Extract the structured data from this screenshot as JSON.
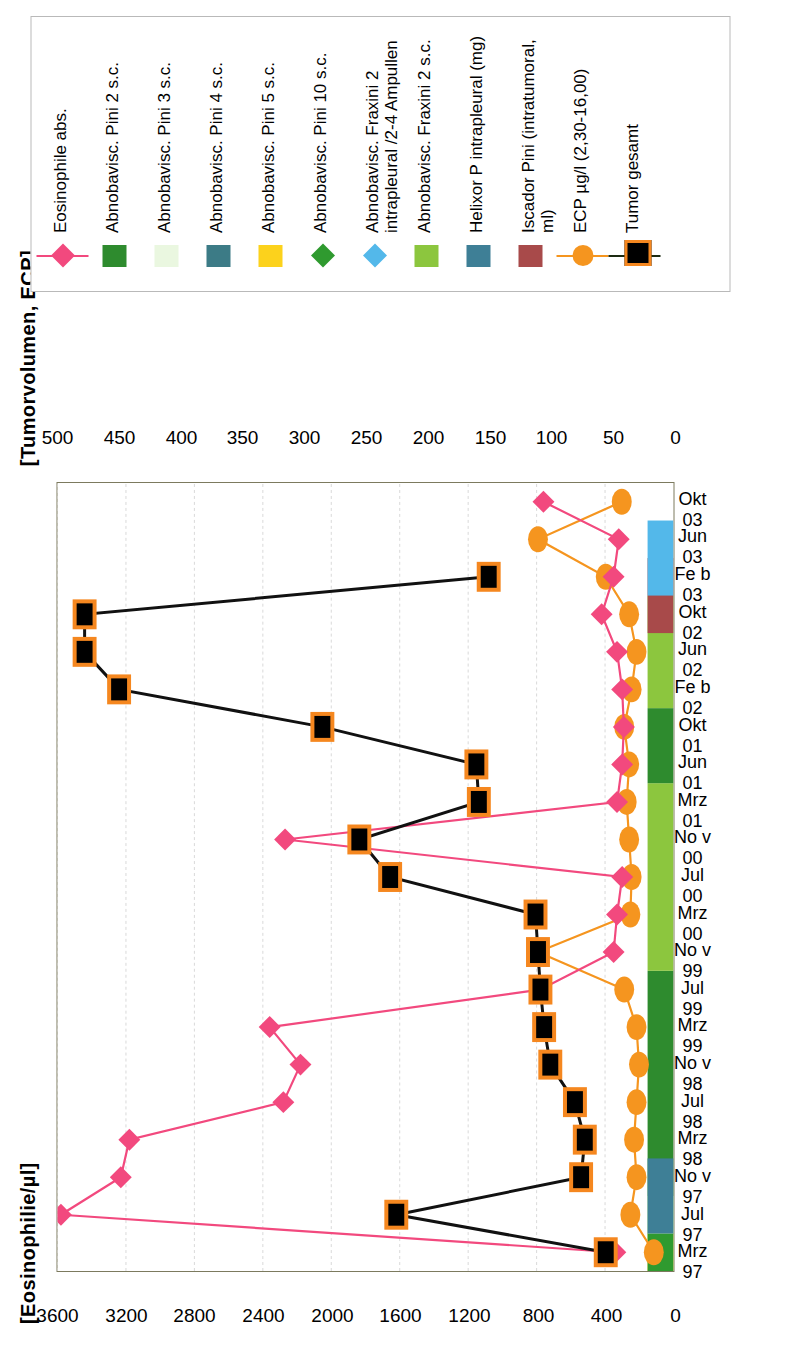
{
  "axes": {
    "left_title": "[Eosinophilie/µl]",
    "right_title": "[Tumorvolumen, ECP]",
    "primary_ticks": [
      "0",
      "400",
      "800",
      "1200",
      "1600",
      "2000",
      "2400",
      "2800",
      "3200",
      "3600"
    ],
    "secondary_ticks": [
      "0",
      "50",
      "100",
      "150",
      "200",
      "250",
      "300",
      "350",
      "400",
      "450",
      "500"
    ],
    "categories": [
      "Mrz\n97",
      "Jul\n97",
      "No\nv\n97",
      "Mrz\n98",
      "Jul\n98",
      "No\nv\n98",
      "Mrz\n99",
      "Jul\n99",
      "No\nv\n99",
      "Mrz\n00",
      "Jul\n00",
      "No\nv\n00",
      "Mrz\n01",
      "Jun\n01",
      "Okt\n01",
      "Fe\nb\n02",
      "Jun\n02",
      "Okt\n02",
      "Fe\nb\n03",
      "Jun\n03",
      "Okt\n03"
    ]
  },
  "legend": {
    "items": [
      {
        "label": "Eosinophile abs.",
        "key": "line-diamond",
        "color": "#f2497e",
        "name": "legend-eosinophile-abs"
      },
      {
        "label": "Abnobavisc. Pini 2 s.c.",
        "key": "square",
        "color": "#2e8b2e",
        "name": "legend-abnoba-pini-2-sc"
      },
      {
        "label": "Abnobavisc. Pini 3 s.c.",
        "key": "square",
        "color": "#eaf7e0",
        "name": "legend-abnoba-pini-3-sc"
      },
      {
        "label": "Abnobavisc. Pini 4 s.c.",
        "key": "square",
        "color": "#3c7b86",
        "name": "legend-abnoba-pini-4-sc"
      },
      {
        "label": "Abnobavisc. Pini 5 s.c.",
        "key": "square",
        "color": "#fcd21c",
        "name": "legend-abnoba-pini-5-sc"
      },
      {
        "label": "Abnobavisc. Pini 10 s.c.",
        "key": "diamond",
        "color": "#2f9a2f",
        "name": "legend-abnoba-pini-10-sc"
      },
      {
        "label": "Abnobavisc. Fraxini 2\nintrapleural /2-4 Ampullen",
        "key": "diamond",
        "color": "#53b8ea",
        "name": "legend-abnoba-fraxini-2-intrapleural"
      },
      {
        "label": "Abnobavisc. Fraxini 2 s.c.",
        "key": "square",
        "color": "#8cc63e",
        "name": "legend-abnoba-fraxini-2-sc"
      },
      {
        "label": "Helixor P intrapleural (mg)",
        "key": "square",
        "color": "#3e7f96",
        "name": "legend-helixor-p-intrapleural"
      },
      {
        "label": "Iscador Pini (intratumoral,\nml)",
        "key": "square",
        "color": "#a84a4a",
        "name": "legend-iscador-pini-intratumoral"
      },
      {
        "label": "ECP µg/l (2,30-16,00)",
        "key": "line-circle",
        "color": "#f5951f",
        "name": "legend-ecp"
      },
      {
        "label": "Tumor gesamt",
        "key": "tumor",
        "color": "#000000",
        "name": "legend-tumor-gesamt"
      }
    ]
  },
  "chart_data": {
    "type": "line",
    "title": "",
    "xlabel": "",
    "ylabel": "[Eosinophilie/µl]",
    "y2label": "[Tumorvolumen, ECP]",
    "ylim": [
      0,
      3600
    ],
    "y2lim": [
      0,
      500
    ],
    "grid": true,
    "legend_position": "right",
    "x": [
      "Mrz 97",
      "Jul 97",
      "Nov 97",
      "Mrz 98",
      "Jul 98",
      "Nov 98",
      "Mrz 99",
      "Jul 99",
      "Nov 99",
      "Mrz 00",
      "Jul 00",
      "Nov 00",
      "Mrz 01",
      "Jun 01",
      "Okt 01",
      "Feb 02",
      "Jun 02",
      "Okt 02",
      "Feb 03",
      "Jun 03",
      "Okt 03"
    ],
    "series": [
      {
        "name": "Eosinophile abs.",
        "axis": "primary",
        "unit": "/µl",
        "color": "#f2497e",
        "marker": "diamond",
        "values": [
          340,
          3580,
          3230,
          3180,
          2280,
          2180,
          2360,
          780,
          350,
          330,
          300,
          2270,
          330,
          300,
          290,
          300,
          330,
          420,
          350,
          320,
          760
        ]
      },
      {
        "name": "ECP µg/l (2,30-16,00)",
        "axis": "secondary",
        "unit": "µg/l",
        "color": "#f5951f",
        "marker": "circle",
        "values": [
          16,
          35,
          30,
          32,
          30,
          28,
          30,
          40,
          110,
          35,
          34,
          36,
          38,
          36,
          40,
          34,
          30,
          36,
          55,
          110,
          42
        ]
      },
      {
        "name": "Tumor gesamt",
        "axis": "secondary",
        "unit": "ml",
        "color": "#000000",
        "marker": "square-orange",
        "values": [
          55,
          225,
          75,
          72,
          80,
          100,
          105,
          108,
          110,
          112,
          230,
          255,
          158,
          160,
          285,
          450,
          478,
          478,
          150,
          null,
          null
        ]
      }
    ],
    "therapy_bars": [
      {
        "label": "Abnobavisc. Pini 5 s.c.",
        "color": "#fcd21c",
        "from": "Mrz 97",
        "to": "Mrz 97"
      },
      {
        "label": "Abnobavisc. Pini 10 s.c.",
        "color": "#2f9a2f",
        "from": "Mrz 97",
        "to": "Jul 97"
      },
      {
        "label": "Abnobavisc. Pini 3 s.c.",
        "color": "#eaf7e0",
        "from": "Jul 97",
        "to": "Jul 97"
      },
      {
        "label": "Abnobavisc. Pini 2 s.c.",
        "color": "#2e8b2e",
        "from": "Nov 97",
        "to": "Jul 99"
      },
      {
        "label": "Abnobavisc. Fraxini 2 s.c.",
        "color": "#8cc63e",
        "from": "Nov 99",
        "to": "Mrz 01"
      },
      {
        "label": "Abnobavisc. Pini 2 s.c.",
        "color": "#2e8b2e",
        "from": "Jun 01",
        "to": "Okt 01"
      },
      {
        "label": "Abnobavisc. Fraxini 2 s.c.",
        "color": "#8cc63e",
        "from": "Feb 02",
        "to": "Okt 02"
      },
      {
        "label": "Iscador Pini (intratumoral, ml)",
        "color": "#a84a4a",
        "from": "Okt 02",
        "to": "Feb 03"
      },
      {
        "label": "Abnobavisc. Fraxini 2 intrapleural /2-4 Ampullen",
        "color": "#53b8ea",
        "from": "Feb 03",
        "to": "Jun 03"
      },
      {
        "label": "Helixor P intrapleural (mg)",
        "color": "#3e7f96",
        "from": "Jul 97",
        "to": "Nov 97"
      }
    ]
  }
}
